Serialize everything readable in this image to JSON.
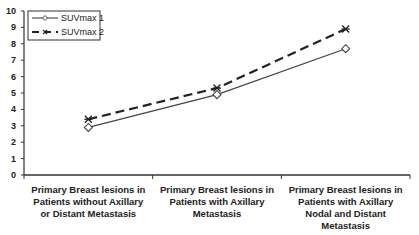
{
  "chart_data": {
    "type": "line",
    "title": "",
    "xlabel": "",
    "ylabel": "",
    "ylim": [
      0,
      10
    ],
    "yticks": [
      0,
      1,
      2,
      3,
      4,
      5,
      6,
      7,
      8,
      9,
      10
    ],
    "grid": false,
    "legend_position": "top-left",
    "categories": [
      "Primary Breast lesions in Patients without Axillary or Distant Metastasis",
      "Primary Breast lesions in Patients with Axillary Metastasis",
      "Primary Breast lesions in Patients with Axillary Nodal and Distant Metastasis"
    ],
    "series": [
      {
        "name": "SUVmax 1",
        "values": [
          2.9,
          4.9,
          7.7
        ],
        "line_style": "solid",
        "marker": "diamond",
        "color": "#444444"
      },
      {
        "name": "SUVmax 2",
        "values": [
          3.4,
          5.3,
          8.9
        ],
        "line_style": "dashed",
        "marker": "star",
        "color": "#222222"
      }
    ]
  },
  "category_labels": [
    [
      "Primary Breast lesions in",
      "Patients without Axillary",
      "or Distant Metastasis"
    ],
    [
      "Primary Breast lesions in",
      "Patients with Axillary",
      "Metastasis"
    ],
    [
      "Primary Breast lesions in",
      "Patients with Axillary",
      "Nodal and Distant",
      "Metastasis"
    ]
  ],
  "legend": [
    "SUVmax 1",
    "SUVmax 2"
  ]
}
